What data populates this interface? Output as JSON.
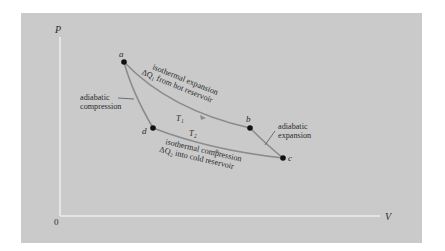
{
  "figure": {
    "background_color": "#cacaca",
    "axis_color": "#ececec",
    "curve_color": "#8c8c8c",
    "point_color": "#111111",
    "axes": {
      "y_label": "P",
      "x_label": "V",
      "origin_label": "0"
    },
    "points": [
      {
        "id": "a",
        "label": "a",
        "x": 124,
        "y": 62
      },
      {
        "id": "b",
        "label": "b",
        "x": 250,
        "y": 128
      },
      {
        "id": "c",
        "label": "c",
        "x": 283,
        "y": 158
      },
      {
        "id": "d",
        "label": "d",
        "x": 153,
        "y": 128
      }
    ],
    "processes": {
      "ab": {
        "line1": "isothermal expansion",
        "line2": "ΔQ₁ from hot reservoir",
        "temp": "T₁"
      },
      "bc": {
        "line1": "adiabatic",
        "line2": "expansion"
      },
      "cd": {
        "line1": "isothermal compression",
        "line2": "ΔQ₂ into cold reservoir",
        "temp": "T₂"
      },
      "da": {
        "line1": "adiabatic",
        "line2": "compression"
      }
    }
  }
}
